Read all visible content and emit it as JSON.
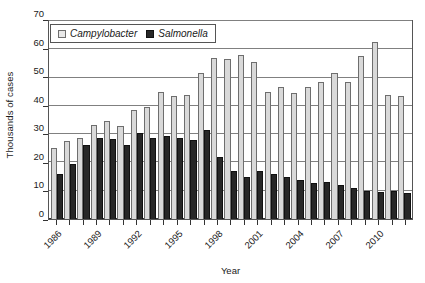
{
  "chart_data": {
    "type": "bar",
    "title": "",
    "xlabel": "Year",
    "ylabel": "Thousands of cases",
    "ylim": [
      0,
      70
    ],
    "yticks": [
      0,
      10,
      20,
      30,
      40,
      50,
      60,
      70
    ],
    "grid": true,
    "legend_position": "top-left-inside",
    "categories": [
      "1986",
      "1987",
      "1988",
      "1989",
      "1990",
      "1991",
      "1992",
      "1993",
      "1994",
      "1995",
      "1996",
      "1997",
      "1998",
      "1999",
      "2000",
      "2001",
      "2002",
      "2003",
      "2004",
      "2005",
      "2006",
      "2007",
      "2008",
      "2009",
      "2010",
      "2011",
      "2012"
    ],
    "xtick_labels": [
      "1986",
      "1989",
      "1992",
      "1995",
      "1998",
      "2001",
      "2004",
      "2007",
      "2010"
    ],
    "xtick_step": 3,
    "series": [
      {
        "name": "Campylobacter",
        "color": "#d9d9d9",
        "values": [
          25.0,
          27.5,
          28.8,
          33.2,
          34.5,
          33.0,
          38.7,
          39.7,
          45.0,
          43.5,
          43.8,
          51.5,
          57.0,
          56.5,
          58.0,
          55.5,
          45.0,
          46.5,
          44.5,
          46.5,
          48.5,
          51.5,
          48.5,
          57.5,
          62.5,
          44.0,
          43.5
        ]
      },
      {
        "name": "Salmonella",
        "color": "#272727",
        "values": [
          16.0,
          19.5,
          26.3,
          28.8,
          28.3,
          26.2,
          30.5,
          28.8,
          29.2,
          28.5,
          28.0,
          31.5,
          22.0,
          16.8,
          14.8,
          17.0,
          15.8,
          15.0,
          13.8,
          12.7,
          13.2,
          12.2,
          11.0,
          10.0,
          9.5,
          9.8,
          9.2
        ]
      }
    ]
  },
  "axes": {
    "y_title": "Thousands of cases",
    "x_title": "Year"
  },
  "legend": {
    "entries": [
      {
        "label": "Campylobacter",
        "swatch": "light-gray-square"
      },
      {
        "label": "Salmonella",
        "swatch": "dark-square"
      }
    ]
  }
}
